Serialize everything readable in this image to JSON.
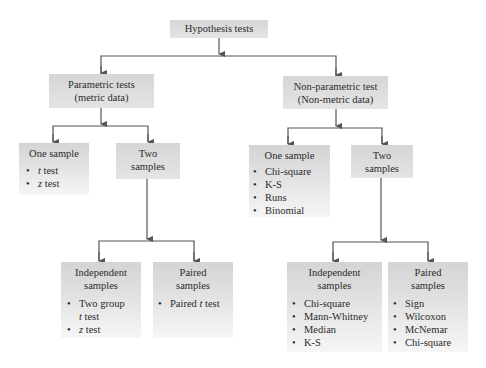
{
  "diagram": {
    "title": "Hypothesis tests",
    "parametric": {
      "title_line1": "Parametric tests",
      "title_line2": "(metric data)",
      "one_sample": {
        "title": "One sample",
        "items": [
          {
            "var": "t",
            "text": " test"
          },
          {
            "var": "z",
            "text": " test"
          }
        ]
      },
      "two_samples": {
        "title_line1": "Two",
        "title_line2": "samples",
        "independent": {
          "title_line1": "Independent",
          "title_line2": "samples",
          "items": [
            {
              "prefix": "Two group",
              "var": "t",
              "text": " test"
            },
            {
              "var": "z",
              "text": " test"
            }
          ]
        },
        "paired": {
          "title_line1": "Paired",
          "title_line2": "samples",
          "items": [
            {
              "prefix": "Paired ",
              "var": "t",
              "text": " test"
            }
          ]
        }
      }
    },
    "nonparametric": {
      "title_line1": "Non-parametric test",
      "title_line2": "(Non-metric data)",
      "one_sample": {
        "title": "One sample",
        "items": [
          "Chi-square",
          "K-S",
          "Runs",
          "Binomial"
        ]
      },
      "two_samples": {
        "title_line1": "Two",
        "title_line2": "samples",
        "independent": {
          "title_line1": "Independent",
          "title_line2": "samples",
          "items": [
            "Chi-square",
            "Mann-Whitney",
            "Median",
            "K-S"
          ]
        },
        "paired": {
          "title_line1": "Paired",
          "title_line2": "samples",
          "items": [
            "Sign",
            "Wilcoxon",
            "McNemar",
            "Chi-square"
          ]
        }
      }
    }
  }
}
